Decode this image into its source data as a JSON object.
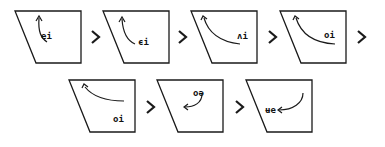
{
  "diagram": {
    "rows": 2,
    "colors": {
      "stroke": "#1a1a1a",
      "background": "#ffffff"
    },
    "panels": [
      {
        "index": 1,
        "label": "ei",
        "arrow": "curve-up-left"
      },
      {
        "index": 2,
        "label": "ϵi",
        "arrow": "curve-up-left"
      },
      {
        "index": 3,
        "label": "ʌi",
        "arrow": "curve-up-left-wide"
      },
      {
        "index": 4,
        "label": "oi",
        "arrow": "curve-up-left-wide"
      },
      {
        "index": 5,
        "label": "oi",
        "arrow": "curve-up-left-flat"
      },
      {
        "index": 6,
        "label": "oə",
        "arrow": "curve-down-left"
      },
      {
        "index": 7,
        "label": "ʉe",
        "arrow": "curve-down-left-long"
      }
    ],
    "connector_icon": "chevron-right-icon",
    "connector_count": 6
  }
}
